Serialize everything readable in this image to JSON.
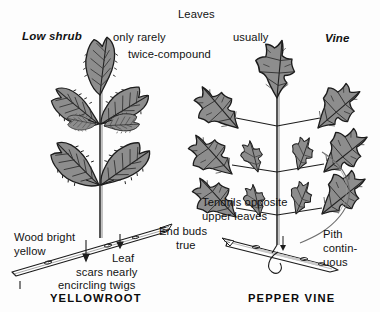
{
  "figure": {
    "kind": "botanical-field-guide-plate",
    "background_color": "#fdfdfd",
    "ink_color": "#121212",
    "leaf_fill_color": "#8d8d8d",
    "leaf_fill_dark_color": "#6f6f6f",
    "leaf_outline_color": "#1c1c1c",
    "twig_fill_color": "#ffffff"
  },
  "left_plant": {
    "caption": "YELLOWROOT",
    "habit_label": "Low shrub",
    "leaf_note_line1": "only rarely",
    "leaf_note_line2": "twice-compound",
    "wood_note_line1": "Wood bright",
    "wood_note_line2": "yellow",
    "scar_note_line1": "Leaf",
    "scar_note_line2": "scars nearly",
    "scar_note_line3": "encircling twigs",
    "bud_note_line1": "End buds",
    "bud_note_line2": "true"
  },
  "right_plant": {
    "caption": "PEPPER VINE",
    "habit_label": "Vine",
    "leaves_label": "Leaves",
    "leaves_qualifier": "usually",
    "tendril_note_line1": "Tendrils opposite",
    "tendril_note_line2": "upper leaves",
    "pith_note_line1": "Pith",
    "pith_note_line2": "contin-",
    "pith_note_line3": "uous"
  }
}
